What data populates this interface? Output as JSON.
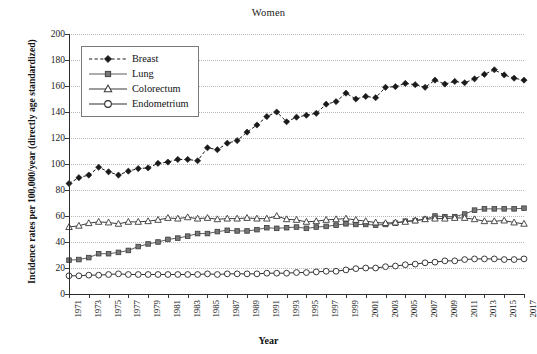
{
  "chart_data": {
    "type": "line",
    "title": "Women",
    "xlabel": "Year",
    "ylabel": "Incidence rates per 100,000/year (directly age standardized)",
    "ylim": [
      0,
      200
    ],
    "ytick_step": 20,
    "yticks": [
      0,
      20,
      40,
      60,
      80,
      100,
      120,
      140,
      160,
      180,
      200
    ],
    "xlim": [
      1971,
      2017
    ],
    "xticks": [
      1971,
      1973,
      1975,
      1977,
      1979,
      1981,
      1983,
      1985,
      1987,
      1989,
      1991,
      1993,
      1995,
      1997,
      1999,
      2001,
      2003,
      2005,
      2007,
      2009,
      2011,
      2013,
      2015,
      2017
    ],
    "x": [
      1971,
      1972,
      1973,
      1974,
      1975,
      1976,
      1977,
      1978,
      1979,
      1980,
      1981,
      1982,
      1983,
      1984,
      1985,
      1986,
      1987,
      1988,
      1989,
      1990,
      1991,
      1992,
      1993,
      1994,
      1995,
      1996,
      1997,
      1998,
      1999,
      2000,
      2001,
      2002,
      2003,
      2004,
      2005,
      2006,
      2007,
      2008,
      2009,
      2010,
      2011,
      2012,
      2013,
      2014,
      2015,
      2016,
      2017
    ],
    "grid": "horizontal-dotted",
    "legend_position": "upper-left-inside",
    "series": [
      {
        "name": "Breast",
        "marker": "filled-diamond",
        "line_style": "dashed",
        "color": "#1a1a1a",
        "values": [
          85,
          89.5,
          91.5,
          97.5,
          94,
          91.5,
          94.5,
          96.5,
          97,
          100.5,
          101.5,
          103.5,
          103.5,
          102.5,
          112.5,
          111,
          116,
          118,
          124.5,
          130,
          136.5,
          140,
          132.5,
          136,
          137.5,
          139,
          146,
          148,
          154.5,
          150,
          152,
          151,
          159,
          159.5,
          162,
          161,
          159,
          164.5,
          161.5,
          163.5,
          162.5,
          165.5,
          169,
          172.5,
          168.5,
          166,
          164.5
        ]
      },
      {
        "name": "Lung",
        "marker": "filled-square",
        "line_style": "solid",
        "color": "#5c5c5c",
        "values": [
          26,
          26.5,
          28,
          31,
          31,
          32,
          33.5,
          36.5,
          38.5,
          40,
          42,
          43,
          44.5,
          46.5,
          46.5,
          48,
          49,
          48.5,
          48.5,
          49.5,
          51,
          50.5,
          51,
          51.5,
          50.5,
          51.5,
          52,
          53,
          54,
          53.5,
          53.5,
          53,
          53.5,
          54.5,
          56,
          56.5,
          57.5,
          60,
          59.5,
          59.5,
          61.5,
          64.5,
          65.5,
          65.5,
          65.5,
          65.5,
          66
        ]
      },
      {
        "name": "Colorectum",
        "marker": "open-triangle",
        "line_style": "solid",
        "color": "#3a3a3a",
        "values": [
          51.5,
          52.5,
          54.5,
          55.5,
          55,
          54,
          55.5,
          55.5,
          56,
          57,
          58.5,
          58,
          59,
          58,
          58.5,
          57.5,
          58,
          58,
          58.5,
          58,
          58,
          60,
          57.5,
          57,
          55.5,
          56,
          57,
          57.5,
          58,
          57,
          56,
          55,
          54.5,
          55,
          55.5,
          56.5,
          57.5,
          58,
          58,
          58.5,
          58.5,
          57.5,
          56,
          56,
          56.5,
          55,
          54
        ]
      },
      {
        "name": "Endometrium",
        "marker": "open-circle",
        "line_style": "solid",
        "color": "#2f2f2f",
        "values": [
          14,
          14,
          14.5,
          14.5,
          15,
          15.5,
          15,
          15,
          15,
          15,
          15,
          15,
          15,
          15,
          15.5,
          15,
          15.5,
          15.5,
          15.5,
          15.5,
          16,
          16,
          16,
          16.5,
          16.5,
          17,
          17.5,
          17.5,
          18.5,
          19.5,
          20,
          20,
          21,
          21.5,
          22.5,
          23,
          24,
          24.5,
          25.5,
          25.5,
          26.5,
          27,
          27,
          27,
          26.5,
          26.5,
          27
        ]
      }
    ]
  },
  "legend": {
    "items": [
      {
        "label": "Breast"
      },
      {
        "label": "Lung"
      },
      {
        "label": "Colorectum"
      },
      {
        "label": "Endometrium"
      }
    ]
  }
}
